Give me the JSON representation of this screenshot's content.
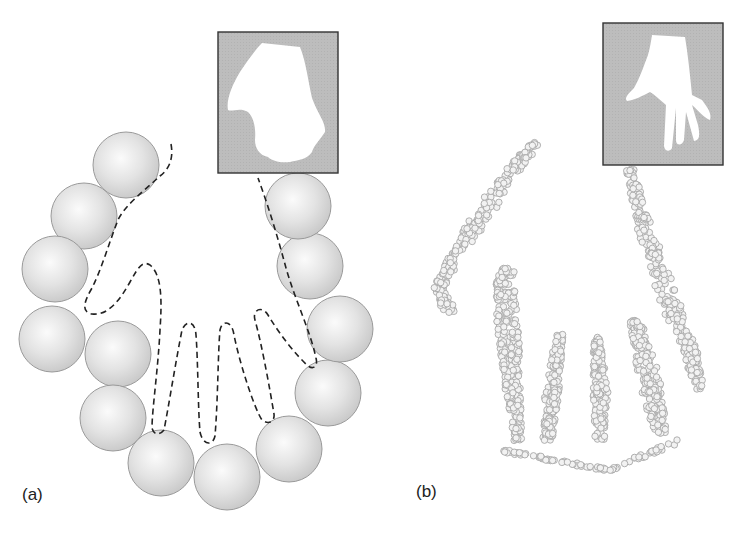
{
  "figure": {
    "panels": [
      {
        "id": "a",
        "label": "(a)",
        "description": "Chain of large spheres with dashed outline of a deformed hand shape; inset shows distorted hand silhouette",
        "inset": {
          "x": 218,
          "y": 32,
          "w": 120,
          "h": 141,
          "bg": "#bdbdbd"
        },
        "spheres": [
          [
            126,
            165
          ],
          [
            84,
            216
          ],
          [
            55,
            269
          ],
          [
            52,
            339
          ],
          [
            118,
            354
          ],
          [
            113,
            418
          ],
          [
            161,
            463
          ],
          [
            227,
            477
          ],
          [
            289,
            449
          ],
          [
            328,
            393
          ],
          [
            340,
            329
          ],
          [
            310,
            266
          ],
          [
            298,
            206
          ]
        ],
        "sphere_radius": 33
      },
      {
        "id": "b",
        "label": "(b)",
        "description": "Dense cloud of small particles forming the shape of a hand; inset shows hand silhouette",
        "inset": {
          "x": 603,
          "y": 23,
          "w": 120,
          "h": 142,
          "bg": "#bdbdbd"
        },
        "particle_radius": 3.2
      }
    ],
    "colors": {
      "sphere_fill": "#e2e2e2",
      "sphere_stroke": "#9a9a9a",
      "dash": "#222222",
      "particle_stroke": "#a8a8a8",
      "frame": "#333333"
    }
  }
}
